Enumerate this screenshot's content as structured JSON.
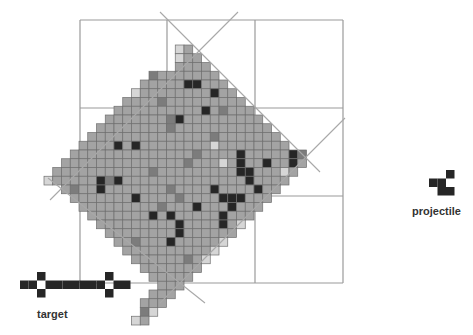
{
  "figure": {
    "type": "cellular-automaton-diagram",
    "colors": {
      "background": "#ffffff",
      "frame": "#9a9a9a",
      "diagonal": "#a8a8a8",
      "cell_fill": "#a3a3a3",
      "cell_border": "#6e6e6e",
      "cell_dark": "#262626",
      "cell_mid": "#7c7c7c",
      "cell_light": "#d6d6d6",
      "shape": "#262626"
    },
    "frame": {
      "x": [
        80,
        167,
        255,
        343
      ],
      "y": [
        20,
        108,
        196,
        283
      ]
    },
    "diagonals": [
      [
        160,
        12,
        320,
        172
      ],
      [
        238,
        12,
        50,
        200
      ],
      [
        345,
        118,
        160,
        303
      ],
      [
        48,
        178,
        205,
        303
      ]
    ],
    "grid": {
      "x0": 44,
      "y0": 45,
      "size": 8.75
    },
    "diamond_rows": [
      [
        0,
        15,
        16
      ],
      [
        1,
        15,
        17
      ],
      [
        2,
        15,
        18
      ],
      [
        3,
        12,
        19
      ],
      [
        4,
        11,
        20
      ],
      [
        5,
        10,
        21
      ],
      [
        6,
        9,
        22
      ],
      [
        7,
        8,
        23
      ],
      [
        8,
        7,
        24
      ],
      [
        9,
        6,
        25
      ],
      [
        10,
        5,
        26
      ],
      [
        11,
        4,
        27
      ],
      [
        12,
        3,
        28
      ],
      [
        13,
        2,
        29
      ],
      [
        14,
        1,
        28
      ],
      [
        15,
        0,
        27
      ],
      [
        16,
        2,
        26
      ],
      [
        17,
        3,
        25
      ],
      [
        18,
        4,
        24
      ],
      [
        19,
        5,
        23
      ],
      [
        20,
        6,
        22
      ],
      [
        21,
        7,
        21
      ],
      [
        22,
        8,
        20
      ],
      [
        23,
        9,
        19
      ],
      [
        24,
        10,
        18
      ],
      [
        25,
        11,
        17
      ],
      [
        26,
        12,
        16
      ],
      [
        27,
        13,
        15
      ],
      [
        28,
        12,
        14
      ],
      [
        29,
        11,
        13
      ],
      [
        30,
        11,
        12
      ],
      [
        31,
        10,
        11
      ]
    ],
    "dark_cells": [
      [
        4,
        16
      ],
      [
        4,
        17
      ],
      [
        5,
        19
      ],
      [
        7,
        18
      ],
      [
        8,
        15
      ],
      [
        11,
        8
      ],
      [
        11,
        10
      ],
      [
        12,
        22
      ],
      [
        13,
        22
      ],
      [
        14,
        22
      ],
      [
        14,
        23
      ],
      [
        13,
        25
      ],
      [
        15,
        6
      ],
      [
        15,
        8
      ],
      [
        15,
        23
      ],
      [
        16,
        6
      ],
      [
        16,
        24
      ],
      [
        17,
        22
      ],
      [
        18,
        21
      ],
      [
        17,
        21
      ],
      [
        18,
        17
      ],
      [
        19,
        12
      ],
      [
        19,
        14
      ],
      [
        20,
        15
      ],
      [
        21,
        15
      ],
      [
        22,
        14
      ],
      [
        12,
        28
      ],
      [
        13,
        28
      ],
      [
        17,
        10
      ],
      [
        19,
        20
      ],
      [
        20,
        20
      ],
      [
        16,
        19
      ],
      [
        17,
        20
      ]
    ],
    "mid_cells": [
      [
        3,
        12
      ],
      [
        6,
        13
      ],
      [
        8,
        14
      ],
      [
        9,
        14
      ],
      [
        7,
        20
      ],
      [
        12,
        17
      ],
      [
        14,
        12
      ],
      [
        16,
        3
      ],
      [
        15,
        7
      ],
      [
        17,
        15
      ],
      [
        18,
        13
      ],
      [
        22,
        10
      ],
      [
        24,
        16
      ],
      [
        30,
        11
      ],
      [
        10,
        19
      ],
      [
        13,
        16
      ],
      [
        16,
        14
      ]
    ],
    "light_cells": [
      [
        0,
        15
      ],
      [
        1,
        15
      ],
      [
        5,
        10
      ],
      [
        11,
        19
      ],
      [
        14,
        27
      ],
      [
        15,
        0
      ],
      [
        13,
        20
      ],
      [
        24,
        18
      ],
      [
        23,
        19
      ],
      [
        22,
        20
      ],
      [
        31,
        10
      ],
      [
        30,
        12
      ],
      [
        20,
        22
      ]
    ],
    "detached_cells": [
      [
        12,
        29
      ]
    ],
    "target": {
      "label": "target",
      "x": 20,
      "y": 272,
      "size": 8.5,
      "cells": [
        [
          1,
          0
        ],
        [
          1,
          1
        ],
        [
          1,
          3
        ],
        [
          1,
          4
        ],
        [
          1,
          5
        ],
        [
          1,
          6
        ],
        [
          1,
          7
        ],
        [
          1,
          8
        ],
        [
          1,
          9
        ],
        [
          1,
          11
        ],
        [
          1,
          12
        ],
        [
          0,
          2
        ],
        [
          2,
          2
        ],
        [
          0,
          10
        ],
        [
          2,
          10
        ]
      ]
    },
    "projectile": {
      "label": "projectile",
      "x": 429,
      "y": 170,
      "size": 8.5,
      "cells": [
        [
          0,
          2
        ],
        [
          1,
          0
        ],
        [
          1,
          1
        ],
        [
          2,
          1
        ],
        [
          2,
          2
        ]
      ]
    }
  }
}
